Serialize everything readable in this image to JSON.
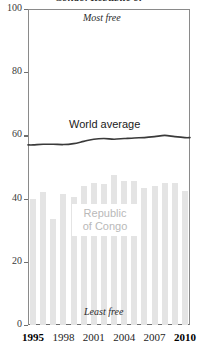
{
  "chart_data": {
    "type": "bar",
    "title": "Congo, Republic of",
    "xlabel": "",
    "ylabel": "",
    "ylim": [
      0,
      100
    ],
    "xlim": [
      1995,
      2010
    ],
    "grid": false,
    "legend_position": "inline-annotations",
    "yticks": [
      "0",
      "20",
      "40",
      "60",
      "80",
      "100"
    ],
    "ytick_values": [
      0,
      20,
      40,
      60,
      80,
      100
    ],
    "xticks": [
      "1995",
      "1998",
      "2001",
      "2004",
      "2007",
      "2010"
    ],
    "xtick_values": [
      1995,
      1998,
      2001,
      2004,
      2007,
      2010
    ],
    "xtick_bold": [
      true,
      false,
      false,
      false,
      false,
      true
    ],
    "categories": [
      1995,
      1996,
      1997,
      1998,
      1999,
      2000,
      2001,
      2002,
      2003,
      2004,
      2005,
      2006,
      2007,
      2008,
      2009,
      2010
    ],
    "series": [
      {
        "name": "Republic of Congo",
        "type": "bar",
        "color": "#e4e4e4",
        "values": [
          40.0,
          42.0,
          33.5,
          41.5,
          40.5,
          44.0,
          45.0,
          44.5,
          47.5,
          45.5,
          45.5,
          43.5,
          44.0,
          45.0,
          45.0,
          42.5
        ]
      },
      {
        "name": "World average",
        "type": "line",
        "color": "#3a3a3a",
        "values": [
          57.0,
          57.2,
          57.2,
          57.1,
          57.4,
          58.1,
          58.8,
          59.0,
          58.8,
          59.0,
          59.2,
          59.3,
          59.6,
          60.0,
          59.6,
          59.3
        ]
      }
    ],
    "annotations": [
      {
        "name": "most-free",
        "text": "Most free",
        "style": "italic"
      },
      {
        "name": "least-free",
        "text": "Least free",
        "style": "italic"
      },
      {
        "name": "world-average",
        "text": "World average",
        "style": "plain"
      },
      {
        "name": "republic-of-congo",
        "text": "Republic\nof Congo",
        "style": "plain",
        "color": "#b9b9b9"
      }
    ]
  },
  "labels": {
    "title_fragment": "Congo, Republic of",
    "most_free": "Most free",
    "least_free": "Least free",
    "world_average": "World average",
    "country_line1": "Republic",
    "country_line2": "of Congo"
  },
  "colors": {
    "bar": "#e4e4e4",
    "line": "#3a3a3a",
    "axis": "#6f6f6f",
    "country_label": "#b9b9b9",
    "background": "#ffffff"
  }
}
